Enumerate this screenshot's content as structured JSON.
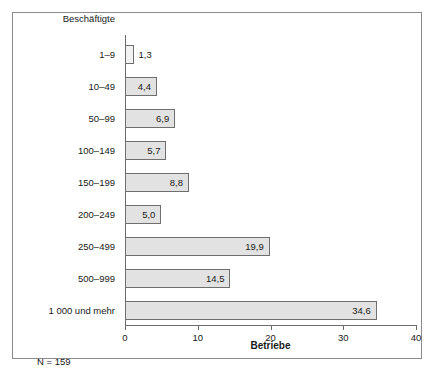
{
  "chart_data": {
    "type": "bar",
    "orientation": "horizontal",
    "title": "",
    "subtitle": "",
    "xlabel": "Betriebe",
    "ylabel": "Beschäftigte",
    "xlim": [
      0,
      40
    ],
    "xticks": [
      "0",
      "10",
      "20",
      "30",
      "40"
    ],
    "xtick_values": [
      0,
      10,
      20,
      30,
      40
    ],
    "grid": false,
    "legend": null,
    "categories": [
      "1–9",
      "10–49",
      "50–99",
      "100–149",
      "150–199",
      "200–249",
      "250–499",
      "500–999",
      "1 000 und mehr"
    ],
    "values": [
      1.3,
      4.4,
      6.9,
      5.7,
      8.8,
      5.0,
      19.9,
      14.5,
      34.6
    ],
    "value_labels": [
      "1,3",
      "4,4",
      "6,9",
      "5,7",
      "8,8",
      "5,0",
      "19,9",
      "14,5",
      "34,6"
    ],
    "label_placement": [
      "outside",
      "inside",
      "inside",
      "inside",
      "inside",
      "inside",
      "inside",
      "inside",
      "inside"
    ],
    "annotation": "N = 159",
    "colors": {
      "bar_fill": "#e2e2e2",
      "bar_fill_light": "#f2f2f2",
      "bar_border": "#6e6e6e",
      "axis": "#6b6b6b",
      "frame": "#8a8a8a",
      "text": "#1a1a1a",
      "background": "#ffffff"
    }
  }
}
